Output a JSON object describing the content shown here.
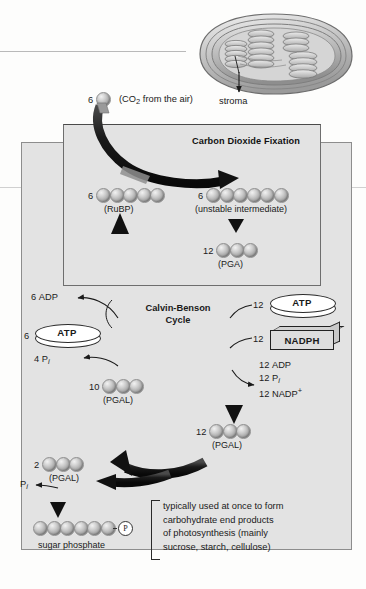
{
  "figure": {
    "title_fixation": "Carbon Dioxide Fixation",
    "cycle_name_line1": "Calvin-Benson",
    "cycle_name_line2": "Cycle",
    "stroma_label": "stroma",
    "co2_count": "6",
    "co2_label_pre": "(CO",
    "co2_label_sub": "2",
    "co2_label_post": " from the air)"
  },
  "molecules": [
    {
      "id": "rubp",
      "count": "6",
      "spheres": 5,
      "caption": "(RuBP)"
    },
    {
      "id": "unstable",
      "count": "6",
      "spheres": 6,
      "caption": "(unstable intermediate)"
    },
    {
      "id": "pga",
      "count": "12",
      "spheres": 3,
      "caption": "(PGA)"
    },
    {
      "id": "pgal10",
      "count": "10",
      "spheres": 3,
      "caption": "(PGAL)"
    },
    {
      "id": "pgal12",
      "count": "12",
      "spheres": 3,
      "caption": "(PGAL)"
    },
    {
      "id": "pgal2",
      "count": "2",
      "spheres": 3,
      "caption": "(PGAL)"
    },
    {
      "id": "sugar",
      "count": "",
      "spheres": 6,
      "caption": "sugar phosphate",
      "phosphate": "P"
    }
  ],
  "left_branch": {
    "adp_count": "6",
    "adp_label": "ADP",
    "atp_count": "6",
    "atp_label": "ATP",
    "pi_count": "4",
    "pi_label_main": "P",
    "pi_label_sub": "i"
  },
  "right_branch": {
    "atp_count": "12",
    "atp_label": "ATP",
    "nadph_count": "12",
    "nadph_label": "NADPH",
    "products": [
      {
        "count": "12",
        "name": "ADP",
        "sub": "",
        "sup": ""
      },
      {
        "count": "12",
        "name": "P",
        "sub": "i",
        "sup": ""
      },
      {
        "count": "12",
        "name": "NADP",
        "sub": "",
        "sup": "+"
      }
    ]
  },
  "bottom_branch": {
    "pi_main": "P",
    "pi_sub": "i"
  },
  "end_note": [
    "typically used at once to form",
    "carbohydrate end products",
    "of photosynthesis (mainly",
    "sucrose, starch, cellulose)"
  ],
  "colors": {
    "panel_bg": "#e3e3e3",
    "panel_border": "#8d8d8d",
    "arrow_dark": "#1c1c1c",
    "sphere_mid": "#a6a6a6",
    "text": "#1a1a1a"
  }
}
